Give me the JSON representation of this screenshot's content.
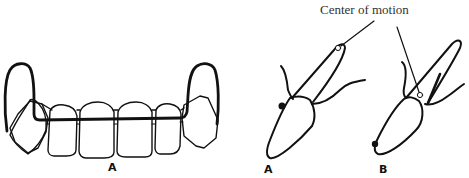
{
  "figure": {
    "panel_left": {
      "label": "A",
      "description": "Anterior view of maxillary incisors and canines with labial arch wire"
    },
    "panel_right": {
      "caption": "Center of motion",
      "subpanels": [
        {
          "label": "A",
          "description": "Tooth tipping with center of motion near root apex"
        },
        {
          "label": "B",
          "description": "Tooth tipping with center of motion near mid-root"
        }
      ]
    }
  },
  "colors": {
    "line": "#111111",
    "background": "#ffffff",
    "caption_text": "#333333"
  }
}
